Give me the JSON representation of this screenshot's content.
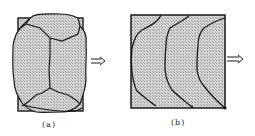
{
  "figure": {
    "panels": [
      {
        "id": "a",
        "caption": "(a)",
        "description": "Rectangular specimen with grain-like cells; outer irregular outline bulges beyond box",
        "arrow": "double-line right arrow"
      },
      {
        "id": "b",
        "caption": "(b)",
        "description": "Square specimen with three curved front lines",
        "arrow": "double-line right arrow"
      }
    ],
    "colors": {
      "fill": "#c8c8c8",
      "line": "#1a1a1a",
      "background": "#ffffff"
    }
  }
}
